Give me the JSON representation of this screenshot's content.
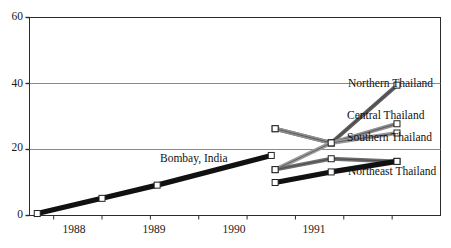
{
  "chart_data": {
    "type": "line",
    "title": "",
    "xlabel": "",
    "ylabel": "",
    "ylim": [
      0,
      60
    ],
    "yticks": [
      0,
      20,
      40,
      60
    ],
    "xlim": [
      1987.5,
      1991.75
    ],
    "xticks": [
      1987.75,
      1988.25,
      1988.75,
      1989.25,
      1989.75,
      1990.25,
      1990.75,
      1991.25
    ],
    "xticklabels": [
      "1988",
      "1989",
      "1990",
      "1991"
    ],
    "xticklabel_positions": [
      1988.0,
      1989.0,
      1990.0,
      1991.0
    ],
    "grid": "horizontal",
    "legend": "inline-right-labels",
    "series": [
      {
        "name": "Bombay, India",
        "color": "#111111",
        "style": "thick-black",
        "label_x": 1989.22,
        "label_y": 19.5,
        "label_anchor": "middle",
        "points": [
          {
            "x": 1987.58,
            "y": 0.6
          },
          {
            "x": 1988.25,
            "y": 5.2
          },
          {
            "x": 1988.82,
            "y": 9.2
          },
          {
            "x": 1990.0,
            "y": 18.2
          }
        ]
      },
      {
        "name": "Northern Thailand",
        "color": "#5e5e5e",
        "style": "dark-grey",
        "label_x": 1991.42,
        "label_y": 40.5,
        "label_anchor": "start",
        "points": [
          {
            "x": 1990.04,
            "y": 26.3
          },
          {
            "x": 1990.62,
            "y": 22.0
          },
          {
            "x": 1991.3,
            "y": 39.5
          }
        ]
      },
      {
        "name": "Central Thailand",
        "color": "#8f8f8f",
        "style": "mid-grey",
        "label_x": 1991.42,
        "label_y": 30.5,
        "label_anchor": "start",
        "points": [
          {
            "x": 1990.04,
            "y": 26.3
          },
          {
            "x": 1990.62,
            "y": 22.0
          },
          {
            "x": 1991.3,
            "y": 27.8
          }
        ]
      },
      {
        "name": "Southern Thailand",
        "color": "#9a9a9a",
        "style": "light-grey",
        "label_x": 1991.42,
        "label_y": 25.0,
        "label_anchor": "start",
        "points": [
          {
            "x": 1990.04,
            "y": 13.9
          },
          {
            "x": 1990.62,
            "y": 22.0
          },
          {
            "x": 1991.3,
            "y": 25.0
          }
        ]
      },
      {
        "name": "Northeast Thailand",
        "color": "#6e6e6e",
        "style": "medium-grey",
        "label_x": 1991.42,
        "label_y": 14.5,
        "label_anchor": "start",
        "points": [
          {
            "x": 1990.04,
            "y": 13.9
          },
          {
            "x": 1990.62,
            "y": 17.2
          },
          {
            "x": 1991.3,
            "y": 16.4
          }
        ]
      },
      {
        "name": "Northeast Thailand lower",
        "color": "#111111",
        "style": "thick-black",
        "label_x": null,
        "label_y": null,
        "label_anchor": "start",
        "points": [
          {
            "x": 1990.04,
            "y": 10.0
          },
          {
            "x": 1990.62,
            "y": 13.2
          },
          {
            "x": 1991.3,
            "y": 16.4
          }
        ]
      }
    ]
  },
  "axes": {
    "y_labels": [
      "0",
      "20",
      "40",
      "60"
    ],
    "x_labels": [
      "1988",
      "1989",
      "1990",
      "1991"
    ]
  },
  "labels": {
    "bombay": "Bombay, India",
    "northern": "Northern Thailand",
    "central": "Central Thailand",
    "southern": "Southern Thailand",
    "northeast": "Northeast Thailand"
  },
  "colors": {
    "axis": "#2b2b2b",
    "grid": "#8a8a8a",
    "background": "#ffffff",
    "bombay": "#111111",
    "northern": "#5e5e5e",
    "central": "#8f8f8f",
    "southern": "#9a9a9a",
    "northeast": "#6e6e6e"
  }
}
